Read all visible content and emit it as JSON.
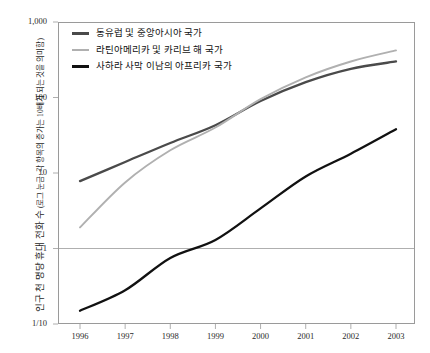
{
  "title": "",
  "axes": {
    "y_ticks": [
      "1,000",
      "100",
      "10",
      "1",
      "1/10"
    ],
    "x_ticks": [
      "1996",
      "1997",
      "1998",
      "1999",
      "2000",
      "2001",
      "2002",
      "2003"
    ],
    "y_title_main": "인구 천 명당 휴대 전화 수",
    "y_title_sub": "(로그 눈금: 각 항목의 증가는 10배가 되는 것을 의미함)"
  },
  "legend": {
    "items": [
      {
        "label": "동유럽 및 중앙아시아 국가",
        "color": "#4a4a4a"
      },
      {
        "label": "라틴아메리카 및 카리브 해 국가",
        "color": "#b0b0b0"
      },
      {
        "label": "사하라 사막 이남의 아프리카 국가",
        "color": "#111111"
      }
    ]
  },
  "colors": {
    "eastern_europe": "#4a4a4a",
    "latin_america": "#b0b0b0",
    "subsaharan": "#111111",
    "frame": "#9a9a9a",
    "gridline": "#9a9a9a",
    "text": "#1a1a1a"
  },
  "chart_data": {
    "type": "line",
    "title": "",
    "xlabel": "",
    "ylabel": "인구 천 명당 휴대 전화 수 (로그 눈금: 각 항목의 증가는 10배가 되는 것을 의미함)",
    "x": [
      1996,
      1997,
      1998,
      1999,
      2000,
      2001,
      2002,
      2003
    ],
    "categories": [
      "1996",
      "1997",
      "1998",
      "1999",
      "2000",
      "2001",
      "2002",
      "2003"
    ],
    "yscale": "log",
    "ylim": [
      0.1,
      1000
    ],
    "y_tick_values": [
      1000,
      100,
      10,
      1,
      0.1
    ],
    "y_tick_labels": [
      "1,000",
      "100",
      "10",
      "1",
      "1/10"
    ],
    "grid": "horizontal gridline at y=1 only",
    "legend_position": "top-left inside plot",
    "series": [
      {
        "name": "동유럽 및 중앙아시아 국가",
        "color": "#4a4a4a",
        "values": [
          7.8,
          14.0,
          25.0,
          43.0,
          90.0,
          160.0,
          240.0,
          300.0
        ]
      },
      {
        "name": "라틴아메리카 및 카리브 해 국가",
        "color": "#b0b0b0",
        "values": [
          1.9,
          7.5,
          20.0,
          40.0,
          95.0,
          185.0,
          300.0,
          420.0
        ]
      },
      {
        "name": "사하라 사막 이남의 아프리카 국가",
        "color": "#111111",
        "values": [
          0.15,
          0.28,
          0.75,
          1.3,
          3.4,
          9.0,
          18.0,
          38.0
        ]
      }
    ]
  }
}
